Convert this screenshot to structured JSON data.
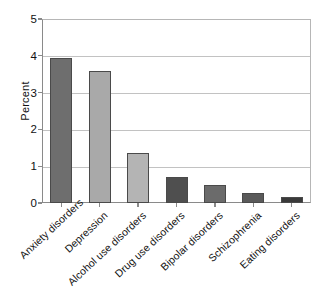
{
  "chart_data": {
    "type": "bar",
    "title": "",
    "subtitle": "",
    "xlabel": "",
    "ylabel": "Percent",
    "categories": [
      "Anxiety disorders",
      "Depression",
      "Alcohol use disorders",
      "Drug use disorders",
      "Bipolar disorders",
      "Schizophrenia",
      "Eating disorders"
    ],
    "values": [
      3.95,
      3.6,
      1.36,
      0.71,
      0.49,
      0.27,
      0.16
    ],
    "bar_colors": [
      "#6e6e6e",
      "#a9a9a9",
      "#b4b4b4",
      "#4f4f4f",
      "#6b6b6b",
      "#5a5a5a",
      "#3a3a3a"
    ],
    "bar_edge_color": "#4a4a4a",
    "ylim": [
      0,
      5
    ],
    "yticks": [
      0,
      1,
      2,
      3,
      4,
      5
    ],
    "ytick_labels": [
      "0",
      "1",
      "2",
      "3",
      "4",
      "5"
    ],
    "grid": true,
    "grid_color": "#c2c2c2",
    "legend": "none",
    "legend_position": "none",
    "axis_color": "#8a8a8a",
    "background": "#ffffff"
  }
}
